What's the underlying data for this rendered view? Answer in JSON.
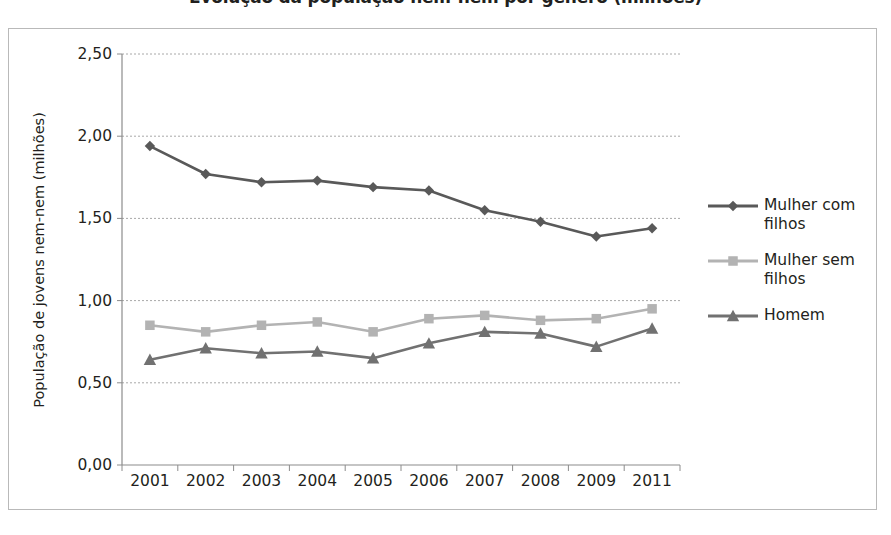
{
  "chart_data": {
    "type": "line",
    "title": "Evolução da população nem-nem por género (milhões)",
    "xlabel": "",
    "ylabel": "População de jovens  nem-nem (milhões)",
    "categories": [
      "2001",
      "2002",
      "2003",
      "2004",
      "2005",
      "2006",
      "2007",
      "2008",
      "2009",
      "2011"
    ],
    "ylim": [
      0.0,
      2.5
    ],
    "ytick_values": [
      2.5,
      2.0,
      1.5,
      1.0,
      0.5,
      0.0
    ],
    "ytick_labels": [
      "2,50",
      "2,00",
      "1,50",
      "1,00",
      "0,50",
      "0,00"
    ],
    "grid": true,
    "legend_position": "right",
    "series": [
      {
        "name": "Mulher com filhos",
        "marker": "diamond",
        "color": "#595959",
        "values": [
          1.94,
          1.77,
          1.72,
          1.73,
          1.69,
          1.67,
          1.55,
          1.48,
          1.39,
          1.44
        ]
      },
      {
        "name": "Mulher sem filhos",
        "marker": "square",
        "color": "#b3b3b3",
        "values": [
          0.85,
          0.81,
          0.85,
          0.87,
          0.81,
          0.89,
          0.91,
          0.88,
          0.89,
          0.95
        ]
      },
      {
        "name": "Homem",
        "marker": "triangle",
        "color": "#717171",
        "values": [
          0.64,
          0.71,
          0.68,
          0.69,
          0.65,
          0.74,
          0.81,
          0.8,
          0.72,
          0.83
        ]
      }
    ]
  },
  "legend": {
    "items": [
      {
        "label_line1": "Mulher com",
        "label_line2": "filhos"
      },
      {
        "label_line1": "Mulher sem",
        "label_line2": "filhos"
      },
      {
        "label_line1": "Homem",
        "label_line2": ""
      }
    ]
  },
  "colors": {
    "series_dark": "#595959",
    "series_light": "#b3b3b3",
    "series_mid": "#717171",
    "frame": "#b9b9b9",
    "grid": "#a8a8a8",
    "axis": "#8c8c8c",
    "text": "#231f20"
  }
}
